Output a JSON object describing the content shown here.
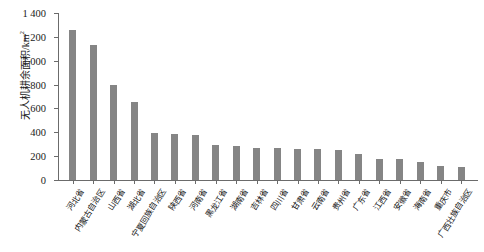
{
  "chart_data": {
    "type": "bar",
    "title": "",
    "xlabel": "",
    "ylabel": "无人机耕余面积/km²",
    "ylim": [
      0,
      1400
    ],
    "ytick_values": [
      0,
      200,
      400,
      600,
      800,
      1000,
      1200,
      1400
    ],
    "ytick_labels": [
      "0",
      "200",
      "400",
      "600",
      "800",
      "1 000",
      "1 200",
      "1 400"
    ],
    "grid": false,
    "legend": "none",
    "bar_color": "#858585",
    "axis_color": "#6b6b6b",
    "categories": [
      "河北省",
      "内蒙古自治区",
      "山西省",
      "湖北省",
      "宁夏回族自治区",
      "陕西省",
      "河南省",
      "黑龙江省",
      "湖南省",
      "吉林省",
      "四川省",
      "甘肃省",
      "云南省",
      "贵州省",
      "广东省",
      "江西省",
      "安徽省",
      "海南省",
      "重庆市",
      "广西壮族自治区"
    ],
    "values": [
      1255,
      1135,
      795,
      650,
      390,
      385,
      380,
      290,
      285,
      270,
      265,
      262,
      258,
      255,
      215,
      180,
      178,
      150,
      120,
      105
    ]
  }
}
